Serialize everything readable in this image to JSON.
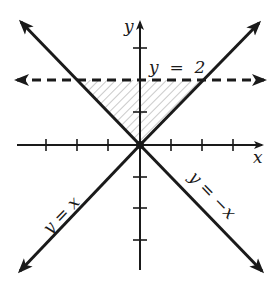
{
  "figure": {
    "type": "coordinate-plane-inequality-region",
    "axes": {
      "x_label": "x",
      "y_label": "y",
      "tick_spacing_units": 1,
      "x_ticks": [
        -3,
        -2,
        -1,
        1,
        2,
        3
      ],
      "y_ticks": [
        -3,
        -2,
        -1,
        1,
        2,
        3
      ]
    },
    "lines": [
      {
        "label": "y = 2",
        "style": "dashed",
        "equation": "y = 2"
      },
      {
        "label": "y = x",
        "style": "solid",
        "equation": "y = x"
      },
      {
        "label": "y = −x",
        "style": "solid",
        "equation": "y = -x"
      }
    ],
    "shaded_region": {
      "description": "triangle bounded by y = x, y = -x and y = 2",
      "vertices": [
        [
          -2,
          2
        ],
        [
          2,
          2
        ],
        [
          0,
          0
        ]
      ],
      "fill": "diagonal hatching"
    },
    "colors": {
      "ink": "#1a1a1a",
      "hatch": "#8a8a8a",
      "background": "#ffffff"
    }
  },
  "labels": {
    "x_axis": "x",
    "y_axis": "y",
    "line_y2": "y  =  2",
    "line_yx": "y = x",
    "line_ynegx": "y = −x"
  }
}
